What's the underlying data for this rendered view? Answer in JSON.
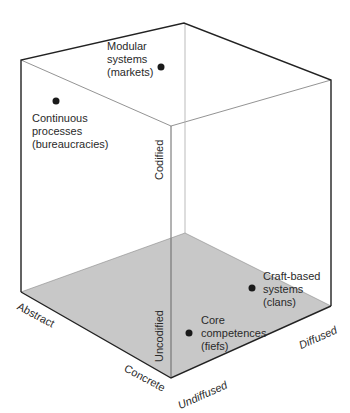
{
  "diagram": {
    "type": "3d-cube",
    "axes": {
      "codification": {
        "high": "Codified",
        "low": "Uncodified"
      },
      "abstraction": {
        "high": "Abstract",
        "low": "Concrete"
      },
      "diffusion": {
        "low": "Undiffused",
        "high": "Diffused"
      }
    },
    "points": [
      {
        "id": "modular",
        "label": "Modular\nsystems\n(markets)"
      },
      {
        "id": "continuous",
        "label": "Continuous\nprocesses\n(bureaucracies)"
      },
      {
        "id": "craft",
        "label": "Craft-based\nsystems\n(clans)"
      },
      {
        "id": "core",
        "label": "Core\ncompetences\n(fiefs)"
      }
    ],
    "colors": {
      "floor": "#c8c8c8",
      "edge": "#222222",
      "inner_edge": "#888888",
      "dot": "#1a1a1a"
    }
  }
}
